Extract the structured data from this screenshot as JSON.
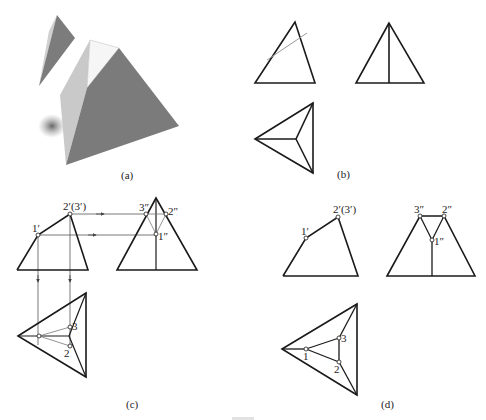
{
  "figure": {
    "panels": {
      "a": {
        "caption": "(a)",
        "description": "3D render of a triangular pyramid with its top corner cut off; the removed wedge floats above-left"
      },
      "b": {
        "caption": "(b)",
        "views": [
          "front view with cutting plane line",
          "side view",
          "top view"
        ]
      },
      "c": {
        "caption": "(c)",
        "front_labels": {
          "p1": "1′",
          "p2": "2′(3′)"
        },
        "side_labels": {
          "p1": "1″",
          "p2": "2″",
          "p3": "3″"
        },
        "top_labels": {
          "p1": "1",
          "p2": "2",
          "p3": "3"
        }
      },
      "d": {
        "caption": "(d)",
        "front_labels": {
          "p1": "1′",
          "p2": "2′(3′)"
        },
        "side_labels": {
          "p1": "1″",
          "p2": "2″",
          "p3": "3″"
        },
        "top_labels": {
          "p1": "1",
          "p2": "2",
          "p3": "3"
        }
      }
    },
    "colors": {
      "line": "#1a1a1a",
      "thin_line": "#555555",
      "cut_line": "#9a9a9a",
      "pyramid_dark": "#7a7a7a",
      "pyramid_light": "#c8c8c8",
      "pyramid_white": "#f4f4f4"
    }
  }
}
